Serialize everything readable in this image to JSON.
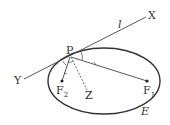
{
  "diagram": {
    "labels": {
      "X": "X",
      "Y": "Y",
      "l": "l",
      "P": "P",
      "F1": "F",
      "F1_sub": "1",
      "F2": "F",
      "F2_sub": "2",
      "Z": "Z",
      "E": "E"
    },
    "ellipse": {
      "cx": 104,
      "cy": 80,
      "rx": 56,
      "ry": 33
    },
    "points": {
      "P": [
        70,
        57
      ],
      "F1": [
        147,
        80
      ],
      "F2": [
        62,
        81
      ],
      "X": [
        148,
        16
      ],
      "Y": [
        24,
        78
      ],
      "Z": [
        88,
        94
      ]
    },
    "colors": {
      "stroke": "#333333"
    }
  }
}
